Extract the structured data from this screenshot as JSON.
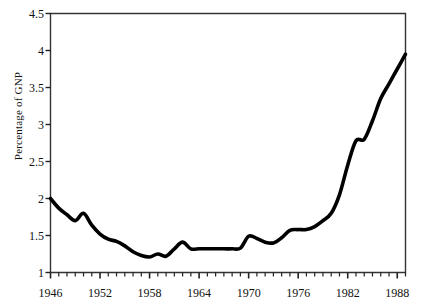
{
  "chart_data": {
    "type": "line",
    "title": "",
    "xlabel": "",
    "ylabel": "Percentage of GNP",
    "xlim": [
      1946,
      1989
    ],
    "ylim": [
      1,
      4.5
    ],
    "grid": false,
    "legend": "none",
    "y_ticks": [
      1,
      1.5,
      2,
      2.5,
      3,
      3.5,
      4,
      4.5
    ],
    "y_tick_labels": [
      "1",
      "1.5",
      "2",
      "2.5",
      "3",
      "3.5",
      "4",
      "4.5"
    ],
    "x_ticks": [
      1946,
      1952,
      1958,
      1964,
      1970,
      1976,
      1982,
      1988
    ],
    "x_tick_labels": [
      "1946",
      "1952",
      "1958",
      "1964",
      "1970",
      "1976",
      "1982",
      "1988"
    ],
    "x_minor_tick_step": 1,
    "line_color": "#000000",
    "line_width": 3.6,
    "x": [
      1946,
      1947,
      1948,
      1949,
      1950,
      1951,
      1952,
      1953,
      1954,
      1955,
      1956,
      1957,
      1958,
      1959,
      1960,
      1961,
      1962,
      1963,
      1964,
      1965,
      1966,
      1967,
      1968,
      1969,
      1970,
      1971,
      1972,
      1973,
      1974,
      1975,
      1976,
      1977,
      1978,
      1979,
      1980,
      1981,
      1982,
      1983,
      1984,
      1985,
      1986,
      1987,
      1988,
      1989
    ],
    "y": [
      2.0,
      1.87,
      1.78,
      1.7,
      1.8,
      1.64,
      1.52,
      1.45,
      1.42,
      1.36,
      1.28,
      1.23,
      1.21,
      1.25,
      1.22,
      1.32,
      1.41,
      1.32,
      1.32,
      1.32,
      1.32,
      1.32,
      1.32,
      1.33,
      1.49,
      1.46,
      1.41,
      1.4,
      1.47,
      1.57,
      1.58,
      1.58,
      1.62,
      1.7,
      1.8,
      2.05,
      2.45,
      2.78,
      2.8,
      3.05,
      3.35,
      3.55,
      3.75,
      3.95
    ]
  },
  "series_name": "percentage-of-gnp"
}
